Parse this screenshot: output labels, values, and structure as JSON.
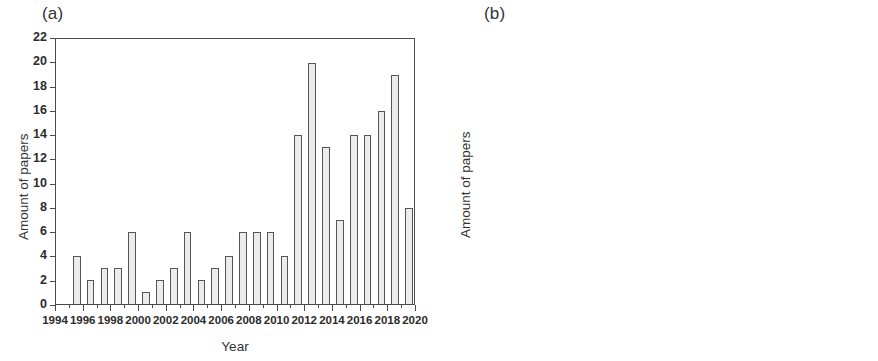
{
  "figure": {
    "panel_a_label": "(a)",
    "panel_b_label": "(b)"
  },
  "chart_data": [
    {
      "type": "bar",
      "title": "(a)",
      "xlabel": "Year",
      "ylabel": "Amount of papers",
      "xlim": [
        1994,
        2020
      ],
      "ylim": [
        0,
        22
      ],
      "ytick_step": 2,
      "xtick_step": 2,
      "grid": false,
      "legend": "none",
      "ytick_labels": [
        "0",
        "2",
        "4",
        "6",
        "8",
        "10",
        "12",
        "14",
        "16",
        "18",
        "20",
        "22"
      ],
      "xtick_labels": [
        "1994",
        "1996",
        "1998",
        "2000",
        "2002",
        "2004",
        "2006",
        "2008",
        "2010",
        "2012",
        "2014",
        "2016",
        "2018",
        "2020"
      ],
      "categories": [
        1995,
        1996,
        1997,
        1998,
        1999,
        2000,
        2001,
        2002,
        2003,
        2004,
        2005,
        2006,
        2007,
        2008,
        2009,
        2010,
        2011,
        2012,
        2013,
        2014,
        2015,
        2016,
        2017,
        2018,
        2019
      ],
      "values": [
        4,
        2,
        3,
        3,
        6,
        1,
        2,
        3,
        6,
        2,
        3,
        4,
        6,
        6,
        6,
        4,
        14,
        20,
        13,
        7,
        14,
        14,
        16,
        19,
        8
      ],
      "bar_fill": "#ececec",
      "bar_edge": "#555555"
    },
    {
      "type": "bar",
      "title": "(b)",
      "xlabel": "Year",
      "ylabel": "Amount of papers",
      "xlim": [
        1994,
        2020
      ],
      "ylim": [
        0,
        18
      ],
      "ytick_step": 2,
      "xtick_step": 2,
      "grid": false,
      "legend": "none",
      "ytick_labels": [
        "0",
        "2",
        "4",
        "6",
        "8",
        "10",
        "12",
        "14",
        "16",
        "18"
      ],
      "xtick_labels": [
        "1994",
        "1996",
        "1998",
        "2000",
        "2002",
        "2004",
        "2006",
        "2008",
        "2010",
        "2012",
        "2014",
        "2016",
        "2018",
        "2020"
      ],
      "categories": [
        1995,
        1996,
        1997,
        1998,
        1999,
        2000,
        2001,
        2002,
        2003,
        2004,
        2005,
        2006,
        2007,
        2008,
        2009,
        2010,
        2011,
        2012,
        2013,
        2014,
        2015,
        2016,
        2017,
        2018,
        2019
      ],
      "values": [
        5,
        14,
        7,
        14,
        12,
        16,
        10,
        14,
        10,
        14,
        14,
        13,
        7,
        11,
        11,
        10,
        11,
        5,
        16,
        10,
        12,
        8,
        12,
        13,
        10
      ],
      "bar_fill": "#ececec",
      "bar_edge": "#555555"
    }
  ]
}
